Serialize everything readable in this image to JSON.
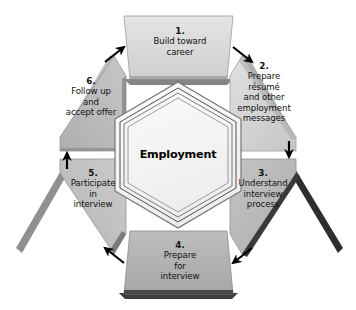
{
  "diagram": {
    "title": "Employment",
    "center": {
      "label": "Employment"
    },
    "steps": [
      {
        "number": "1.",
        "text": "Build toward\ncareer",
        "lines": [
          "Build toward",
          "career"
        ],
        "position": "top",
        "fill": "#d9d9d9"
      },
      {
        "number": "2.",
        "text": "Prepare\nrésumé\nand other\nemployment\nmessages",
        "lines": [
          "Prepare",
          "résumé",
          "and other",
          "employment",
          "messages"
        ],
        "position": "top-right",
        "fill": "#d2d2d2"
      },
      {
        "number": "3.",
        "text": "Understand\ninterview\nprocess",
        "lines": [
          "Understand",
          "interview",
          "process"
        ],
        "position": "bottom-right",
        "fill": "#b9b9b9"
      },
      {
        "number": "4.",
        "text": "Prepare\nfor\ninterview",
        "lines": [
          "Prepare",
          "for",
          "interview"
        ],
        "position": "bottom",
        "fill": "#b2b2b2"
      },
      {
        "number": "5.",
        "text": "Participate\nin\ninterview",
        "lines": [
          "Participate",
          "in",
          "interview"
        ],
        "position": "bottom-left",
        "fill": "#c4c4c4"
      },
      {
        "number": "6.",
        "text": "Follow up\nand\naccept offer",
        "lines": [
          "Follow up",
          "and",
          "accept offer"
        ],
        "position": "top-left",
        "fill": "#bdbdbd"
      }
    ],
    "arrows": [
      {
        "name": "arrow-step6-to-step1",
        "direction": "up-right"
      },
      {
        "name": "arrow-step1-to-step2",
        "direction": "down-right"
      },
      {
        "name": "arrow-step2-to-step3",
        "direction": "down"
      },
      {
        "name": "arrow-step3-to-step4",
        "direction": "down-left"
      },
      {
        "name": "arrow-step4-to-step5",
        "direction": "up-left"
      },
      {
        "name": "arrow-step5-to-step6",
        "direction": "up"
      }
    ],
    "colors": {
      "background": "#ffffff",
      "shadow": "#4a4a4a",
      "outline": "#8a8a8a",
      "arrow": "#000000",
      "text": "#111111"
    }
  }
}
